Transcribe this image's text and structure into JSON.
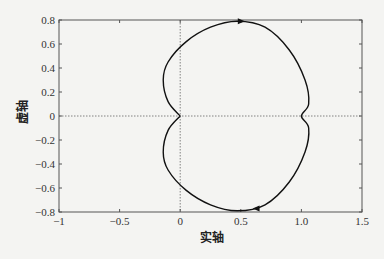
{
  "chart_data": {
    "type": "line",
    "title": "",
    "xlabel": "实轴",
    "ylabel": "虚轴",
    "xlim": [
      -1,
      1.5
    ],
    "ylim": [
      -0.8,
      0.8
    ],
    "xticks": [
      -1,
      -0.5,
      0,
      0.5,
      1.0,
      1.5
    ],
    "xtick_labels": [
      "-1",
      "-0.5",
      "0",
      "0.5",
      "1.0",
      "1.5"
    ],
    "yticks": [
      0.8,
      0.6,
      0.4,
      0.2,
      0,
      -0.2,
      -0.4,
      -0.6,
      -0.8
    ],
    "ytick_labels": [
      "0.8",
      "0.6",
      "0.4",
      "0.2",
      "0",
      "-0.2",
      "-0.4",
      "-0.6",
      "-0.8"
    ],
    "grid": false,
    "reference_lines": [
      {
        "axis": "x",
        "value": 0,
        "style": "dotted"
      },
      {
        "axis": "y",
        "value": 0,
        "style": "dotted"
      }
    ],
    "series": [
      {
        "name": "Nyquist curve",
        "x": [
          0,
          -0.1,
          -0.14,
          -0.1,
          0.05,
          0.25,
          0.47,
          0.7,
          0.9,
          1.03,
          1.06,
          1.0,
          1.06,
          1.03,
          0.9,
          0.7,
          0.47,
          0.25,
          0.05,
          -0.1,
          -0.14,
          -0.1,
          0
        ],
        "y": [
          0,
          0.12,
          0.3,
          0.45,
          0.62,
          0.74,
          0.79,
          0.74,
          0.55,
          0.3,
          0.1,
          0,
          -0.1,
          -0.3,
          -0.55,
          -0.74,
          -0.79,
          -0.74,
          -0.62,
          -0.45,
          -0.3,
          -0.12,
          0
        ],
        "arrows": [
          {
            "x": 0.5,
            "y": 0.79,
            "direction": "right"
          },
          {
            "x": 0.63,
            "y": -0.77,
            "direction": "left"
          }
        ]
      }
    ]
  }
}
